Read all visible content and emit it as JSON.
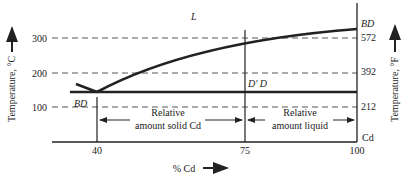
{
  "diagram": {
    "type": "phase-diagram",
    "title": "",
    "region_label_liquid": "L",
    "left_axis": {
      "label": "Temperature, °C",
      "ticks": [
        "300",
        "200",
        "100"
      ]
    },
    "right_axis": {
      "label": "Temperature, °F",
      "ticks": [
        "572",
        "392",
        "212"
      ]
    },
    "x_axis": {
      "label": "% Cd",
      "ticks": [
        "40",
        "75",
        "100"
      ],
      "end_label": "Cd"
    },
    "labels": {
      "bd_left": "BD",
      "bd_right": "BD",
      "d_prime_d": "D' D",
      "solid_line1": "Relative",
      "solid_line2": "amount solid Cd",
      "liquid_line1": "Relative",
      "liquid_line2": "amount liquid"
    },
    "colors": {
      "line": "#1a1a1a",
      "dash": "#555555"
    }
  }
}
